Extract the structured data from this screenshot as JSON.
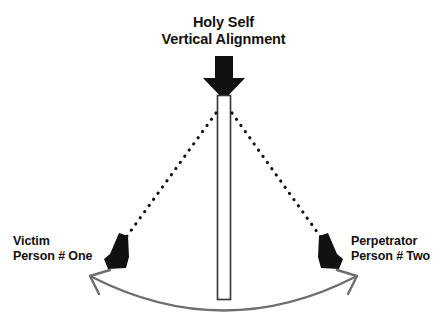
{
  "diagram": {
    "background_color": "#ffffff",
    "title": {
      "line1": "Holy Self",
      "line2": "Vertical Alignment"
    },
    "left_label": {
      "line1": "Victim",
      "line2": "Person # One"
    },
    "right_label": {
      "line1": "Perpetrator",
      "line2": "Person # Two"
    },
    "elements": {
      "down_arrow_name": "down-arrow-icon",
      "vertical_bar_name": "vertical-alignment-bar",
      "left_dotted_line_name": "dotted-line-left",
      "right_dotted_line_name": "dotted-line-right",
      "left_wedge_name": "left-wedge-arrowhead",
      "right_wedge_name": "right-wedge-arrowhead",
      "arc_name": "curved-double-arrow"
    },
    "colors": {
      "ink": "#111111",
      "bar_fill": "#ffffff",
      "bar_stroke": "#333333",
      "arc": "#6e6e6e",
      "dots": "#111111"
    }
  }
}
